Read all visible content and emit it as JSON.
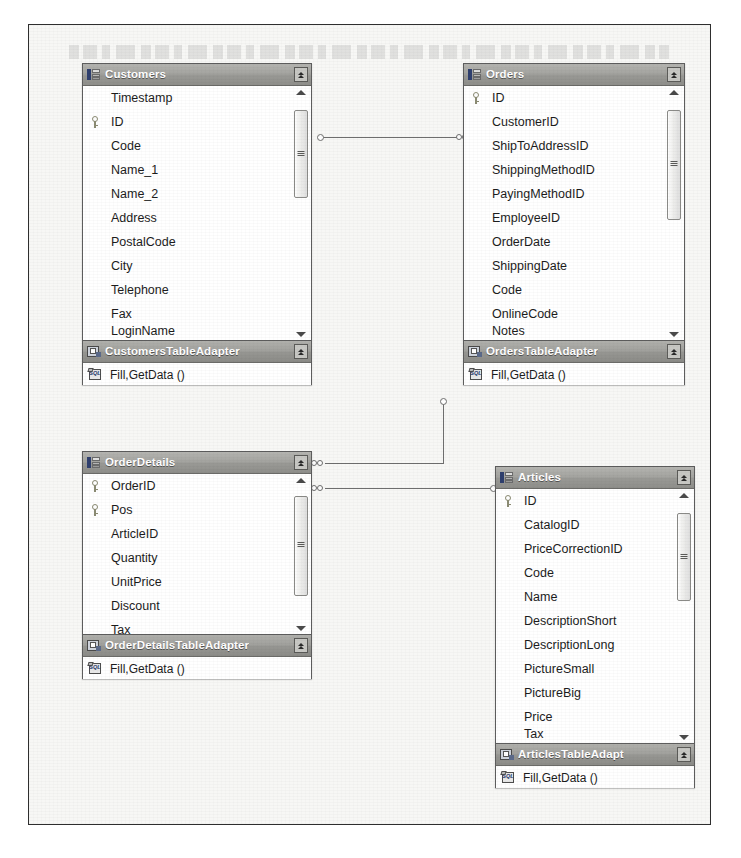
{
  "diagram": {
    "type": "dataset-designer",
    "entities": [
      {
        "id": "customers",
        "name": "Customers",
        "icon": "table-icon",
        "collapse_icon": "chevron-up-icon",
        "fields": [
          {
            "name": "Timestamp",
            "key": false
          },
          {
            "name": "ID",
            "key": true
          },
          {
            "name": "Code",
            "key": false
          },
          {
            "name": "Name_1",
            "key": false
          },
          {
            "name": "Name_2",
            "key": false
          },
          {
            "name": "Address",
            "key": false
          },
          {
            "name": "PostalCode",
            "key": false
          },
          {
            "name": "City",
            "key": false
          },
          {
            "name": "Telephone",
            "key": false
          },
          {
            "name": "Fax",
            "key": false
          },
          {
            "name": "LoginName",
            "key": false
          }
        ],
        "adapter": {
          "name": "CustomersTableAdapter",
          "icon": "adapter-icon",
          "collapse_icon": "chevron-up-icon",
          "methods": [
            {
              "name": "Fill,GetData ()",
              "icon": "sql-query-icon"
            }
          ]
        }
      },
      {
        "id": "orders",
        "name": "Orders",
        "icon": "table-icon",
        "collapse_icon": "chevron-up-icon",
        "fields": [
          {
            "name": "ID",
            "key": true
          },
          {
            "name": "CustomerID",
            "key": false
          },
          {
            "name": "ShipToAddressID",
            "key": false
          },
          {
            "name": "ShippingMethodID",
            "key": false
          },
          {
            "name": "PayingMethodID",
            "key": false
          },
          {
            "name": "EmployeeID",
            "key": false
          },
          {
            "name": "OrderDate",
            "key": false
          },
          {
            "name": "ShippingDate",
            "key": false
          },
          {
            "name": "Code",
            "key": false
          },
          {
            "name": "OnlineCode",
            "key": false
          },
          {
            "name": "Notes",
            "key": false
          }
        ],
        "adapter": {
          "name": "OrdersTableAdapter",
          "icon": "adapter-icon",
          "collapse_icon": "chevron-up-icon",
          "methods": [
            {
              "name": "Fill,GetData ()",
              "icon": "sql-query-icon"
            }
          ]
        }
      },
      {
        "id": "orderdetails",
        "name": "OrderDetails",
        "icon": "table-icon",
        "collapse_icon": "chevron-up-icon",
        "fields": [
          {
            "name": "OrderID",
            "key": true
          },
          {
            "name": "Pos",
            "key": true
          },
          {
            "name": "ArticleID",
            "key": false
          },
          {
            "name": "Quantity",
            "key": false
          },
          {
            "name": "UnitPrice",
            "key": false
          },
          {
            "name": "Discount",
            "key": false
          },
          {
            "name": "Tax",
            "key": false
          }
        ],
        "adapter": {
          "name": "OrderDetailsTableAdapter",
          "icon": "adapter-icon",
          "collapse_icon": "chevron-up-icon",
          "methods": [
            {
              "name": "Fill,GetData ()",
              "icon": "sql-query-icon"
            }
          ]
        }
      },
      {
        "id": "articles",
        "name": "Articles",
        "icon": "table-icon",
        "collapse_icon": "chevron-up-icon",
        "fields": [
          {
            "name": "ID",
            "key": true
          },
          {
            "name": "CatalogID",
            "key": false
          },
          {
            "name": "PriceCorrectionID",
            "key": false
          },
          {
            "name": "Code",
            "key": false
          },
          {
            "name": "Name",
            "key": false
          },
          {
            "name": "DescriptionShort",
            "key": false
          },
          {
            "name": "DescriptionLong",
            "key": false
          },
          {
            "name": "PictureSmall",
            "key": false
          },
          {
            "name": "PictureBig",
            "key": false
          },
          {
            "name": "Price",
            "key": false
          },
          {
            "name": "Tax",
            "key": false
          }
        ],
        "adapter": {
          "name": "ArticlesTableAdapt",
          "icon": "adapter-icon",
          "collapse_icon": "chevron-up-icon",
          "methods": [
            {
              "name": "Fill,GetData ()",
              "icon": "sql-query-icon"
            }
          ]
        }
      }
    ],
    "relations": [
      {
        "id": "rel-customers-orders",
        "from": "Customers",
        "to": "Orders",
        "from_card": "one",
        "to_card": "many"
      },
      {
        "id": "rel-orders-orderdetails",
        "from": "Orders",
        "to": "OrderDetails",
        "from_card": "one",
        "to_card": "many"
      },
      {
        "id": "rel-orderdetails-articles",
        "from": "OrderDetails",
        "to": "Articles",
        "from_card": "many",
        "to_card": "one"
      }
    ]
  }
}
